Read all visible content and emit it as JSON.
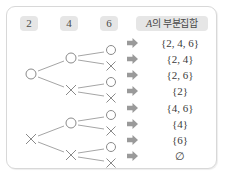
{
  "card": {
    "border_color": "#d8d8d8",
    "background": "#ffffff"
  },
  "header": {
    "badge_color": "#e6e6e6",
    "columns": [
      {
        "label": "2"
      },
      {
        "label": "4"
      },
      {
        "label": "6"
      }
    ],
    "result_header": {
      "italic_part": "A",
      "rest": "의 부분집합"
    }
  },
  "tree": {
    "mark_include": "○",
    "mark_exclude": "×",
    "line_color": "#9a9a9a",
    "mark_color": "#8a8a8a",
    "level1": [
      {
        "mark": "○",
        "x": 24,
        "y": 67
      },
      {
        "mark": "×",
        "x": 24,
        "y": 132
      }
    ],
    "level2": [
      {
        "mark": "○",
        "x": 64,
        "y": 51
      },
      {
        "mark": "×",
        "x": 64,
        "y": 83
      },
      {
        "mark": "○",
        "x": 64,
        "y": 116
      },
      {
        "mark": "×",
        "x": 64,
        "y": 148
      }
    ],
    "level3": [
      {
        "mark": "○",
        "x": 104,
        "y": 43
      },
      {
        "mark": "×",
        "x": 104,
        "y": 59
      },
      {
        "mark": "○",
        "x": 104,
        "y": 75
      },
      {
        "mark": "×",
        "x": 104,
        "y": 91
      },
      {
        "mark": "○",
        "x": 104,
        "y": 108
      },
      {
        "mark": "×",
        "x": 104,
        "y": 124
      },
      {
        "mark": "○",
        "x": 104,
        "y": 140
      },
      {
        "mark": "×",
        "x": 104,
        "y": 156
      }
    ]
  },
  "arrow": {
    "glyph": "➡",
    "color": "#9a9a9a",
    "count": 8
  },
  "results": [
    {
      "text": "{2, 4, 6}",
      "y": 36
    },
    {
      "text": "{2, 4}",
      "y": 52
    },
    {
      "text": "{2, 6}",
      "y": 68
    },
    {
      "text": "{2}",
      "y": 84
    },
    {
      "text": "{4, 6}",
      "y": 101
    },
    {
      "text": "{4}",
      "y": 117
    },
    {
      "text": "{6}",
      "y": 133
    },
    {
      "text": "∅",
      "y": 149
    }
  ]
}
